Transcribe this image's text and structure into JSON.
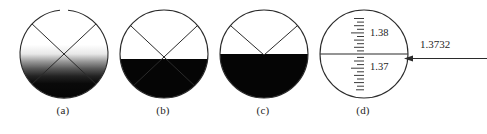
{
  "figure": {
    "background_color": "#ffffff",
    "line_color": "#2b2b2b",
    "fill_dark": "#050505",
    "panels": [
      {
        "id": "a",
        "caption": "(a)",
        "description": "crosshair X with blurred out-of-focus boundary",
        "boundary_state": "blurred",
        "boundary_y_fraction": 0.55,
        "crosshair": "X",
        "crosshair_vertex_offset": 0,
        "shading": "gradient"
      },
      {
        "id": "b",
        "caption": "(b)",
        "description": "sharp boundary above crosshair vertex, misaligned",
        "boundary_state": "sharp",
        "boundary_y_fraction": 0.55,
        "crosshair": "X",
        "crosshair_vertex_offset": 10,
        "shading": "solid"
      },
      {
        "id": "c",
        "caption": "(c)",
        "description": "sharp boundary aligned with crosshair vertex",
        "boundary_state": "sharp",
        "boundary_y_fraction": 0.5,
        "crosshair": "V",
        "crosshair_vertex_offset": 0,
        "shading": "solid"
      },
      {
        "id": "d",
        "caption": "(d)",
        "description": "refractive index scale with index line",
        "boundary_state": "scale",
        "boundary_y_fraction": 0.5,
        "crosshair": "none",
        "shading": "none",
        "scale": {
          "major_labels": [
            "1.38",
            "1.37"
          ],
          "major_label_upper": "1.38",
          "major_label_lower": "1.37",
          "tick_count": 25,
          "tick_spacing_px": 3.6,
          "tick_pattern": "alternating long and short"
        }
      }
    ],
    "reading": {
      "value": "1.3732",
      "arrow_direction": "left",
      "arrow_points_to": "scale index line"
    }
  }
}
